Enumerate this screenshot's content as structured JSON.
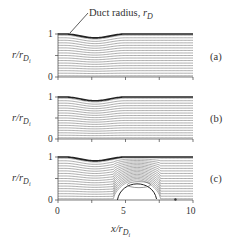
{
  "figure": {
    "annotation": "Duct radius, ",
    "annotation_symbol": "r",
    "annotation_sub": "D",
    "ylabel_r": "r/r",
    "ylabel_sub": "D",
    "ylabel_subsub": "i",
    "xlabel_x": "x/r",
    "xlabel_sub": "D",
    "xlabel_subsub": "i",
    "panels": [
      {
        "label": "(a)",
        "ytick_top": "1",
        "ytick_bottom": "0"
      },
      {
        "label": "(b)",
        "ytick_top": "1",
        "ytick_bottom": "0"
      },
      {
        "label": "(c)",
        "ytick_top": "1",
        "ytick_bottom": "0"
      }
    ],
    "xticks": [
      "0",
      "5",
      "10"
    ]
  },
  "chart_data": [
    {
      "type": "line",
      "title": "(a)",
      "xlabel": "x/r_Di",
      "ylabel": "r/r_Di",
      "xlim": [
        0,
        10
      ],
      "ylim": [
        0,
        1
      ],
      "description": "Streamlines in duct with wall contraction near x≈2.5; no separation",
      "duct_radius": {
        "x": [
          0,
          1,
          2.5,
          4,
          5,
          10
        ],
        "y": [
          1,
          0.97,
          0.9,
          0.97,
          1,
          1
        ]
      },
      "streamline_count": 17
    },
    {
      "type": "line",
      "title": "(b)",
      "xlabel": "x/r_Di",
      "ylabel": "r/r_Di",
      "xlim": [
        0,
        10
      ],
      "ylim": [
        0,
        1
      ],
      "description": "Streamlines, same duct geometry; no separation",
      "duct_radius": {
        "x": [
          0,
          1,
          2.5,
          4,
          5,
          10
        ],
        "y": [
          1,
          0.97,
          0.9,
          0.97,
          1,
          1
        ]
      },
      "streamline_count": 17
    },
    {
      "type": "line",
      "title": "(c)",
      "xlabel": "x/r_Di",
      "ylabel": "r/r_Di",
      "xlim": [
        0,
        10
      ],
      "ylim": [
        0,
        1
      ],
      "description": "Streamlines with recirculation bubble on axis between x≈4.4 and x≈7.3, up to r≈0.45; stagnation points near x≈4.4 and x≈8.7",
      "duct_radius": {
        "x": [
          0,
          1,
          2.5,
          4,
          5,
          10
        ],
        "y": [
          1,
          0.97,
          0.9,
          0.97,
          1,
          1
        ]
      },
      "recirculation": {
        "x_start": 4.4,
        "x_end": 7.3,
        "r_max": 0.45
      },
      "streamline_count": 17
    }
  ]
}
